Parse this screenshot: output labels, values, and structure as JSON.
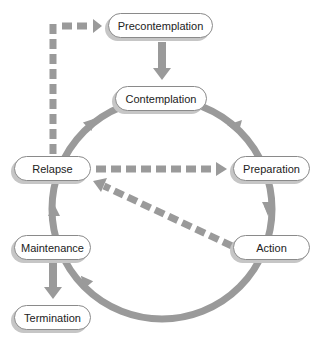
{
  "diagram": {
    "colors": {
      "arrow": "#9a9a9a",
      "pill_border": "#8a8a8a",
      "pill_shadow": "#c6c6c6",
      "text": "#222222",
      "background": "#ffffff"
    },
    "stages": [
      {
        "id": "precontemplation",
        "label": "Precontemplation"
      },
      {
        "id": "contemplation",
        "label": "Contemplation"
      },
      {
        "id": "preparation",
        "label": "Preparation"
      },
      {
        "id": "action",
        "label": "Action"
      },
      {
        "id": "maintenance",
        "label": "Maintenance"
      },
      {
        "id": "relapse",
        "label": "Relapse"
      },
      {
        "id": "termination",
        "label": "Termination"
      }
    ],
    "edges": [
      {
        "from": "precontemplation",
        "to": "contemplation",
        "style": "solid"
      },
      {
        "from": "contemplation",
        "to": "preparation",
        "style": "cycle"
      },
      {
        "from": "preparation",
        "to": "action",
        "style": "cycle"
      },
      {
        "from": "action",
        "to": "maintenance",
        "style": "cycle"
      },
      {
        "from": "maintenance",
        "to": "relapse",
        "style": "cycle"
      },
      {
        "from": "relapse",
        "to": "contemplation",
        "style": "cycle"
      },
      {
        "from": "maintenance",
        "to": "termination",
        "style": "solid"
      },
      {
        "from": "relapse",
        "to": "precontemplation",
        "style": "dashed"
      },
      {
        "from": "relapse",
        "to": "preparation",
        "style": "dashed"
      },
      {
        "from": "action",
        "to": "relapse",
        "style": "dashed"
      }
    ]
  }
}
